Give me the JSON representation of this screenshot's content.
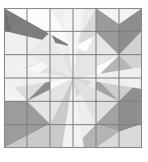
{
  "figure": {
    "kind": "quilt-block-pattern",
    "title": "",
    "canvas": {
      "width": 148,
      "height": 162,
      "background": "#ffffff"
    },
    "block": {
      "x": 4,
      "y": 8,
      "width": 138,
      "height": 140,
      "rows": 6,
      "cols": 6,
      "cell_width": 23.0,
      "cell_height": 23.333,
      "border_color": "#8a8a8a",
      "border_width": 1.1,
      "grid_line_color": "#7d7d7d",
      "grid_line_width": 1.0,
      "grid_visible": true
    },
    "palette": {
      "background": "#ffffff",
      "white": "#fdfdfd",
      "lightest": "#f2f2f2",
      "lighter": "#e8e8e8",
      "light": "#dcdcdc",
      "light_mid": "#cfcfcf",
      "mid": "#bdbdbd",
      "mid_dark": "#a8a8a8",
      "dark": "#8f8f8f",
      "darkest": "#6f6f6f",
      "outline": "#7d7d7d"
    },
    "motifs": [
      {
        "name": "pinwheel-star-top-left",
        "quadrant": "top-left",
        "center": {
          "x": 38.5,
          "y": 43.0
        },
        "rays": 8,
        "dominant_shade": "#6f6f6f"
      },
      {
        "name": "pinwheel-star-top-right",
        "quadrant": "top-right",
        "center": {
          "x": 107.5,
          "y": 43.0
        },
        "rays": 8,
        "dominant_shade": "#8f8f8f"
      },
      {
        "name": "pinwheel-star-bottom-left",
        "quadrant": "bottom-left",
        "center": {
          "x": 38.5,
          "y": 113.0
        },
        "rays": 8,
        "dominant_shade": "#8f8f8f"
      },
      {
        "name": "pinwheel-star-bottom-right",
        "quadrant": "bottom-right",
        "center": {
          "x": 107.5,
          "y": 113.0
        },
        "rays": 8,
        "dominant_shade": "#8f8f8f"
      },
      {
        "name": "central-starburst",
        "quadrant": "center",
        "center": {
          "x": 73.0,
          "y": 78.0
        },
        "rays": 8,
        "dominant_shade": "#cfcfcf"
      }
    ],
    "shapes": [
      {
        "id": "tl-dark-wedge-upper",
        "points": "4,8 73,47 4,31",
        "fill": "#6f6f6f"
      },
      {
        "id": "tl-dark-wedge-lower",
        "points": "4,8 73,47 27,78",
        "fill": "#7d7d7d"
      },
      {
        "id": "tl-light-wedge-a",
        "points": "4,31 73,47 4,78",
        "fill": "#f0f0f0"
      },
      {
        "id": "tl-light-wedge-b",
        "points": "27,78 73,47 73,78",
        "fill": "#e2e2e2"
      },
      {
        "id": "tl-pale-top",
        "points": "4,8 50,8 73,47",
        "fill": "#fbfbfb"
      },
      {
        "id": "tl-pale-right",
        "points": "50,8 73,8 73,47",
        "fill": "#efefef"
      },
      {
        "id": "tl-pale-bottom",
        "points": "4,78 73,47 4,101",
        "fill": "#f7f7f7"
      },
      {
        "id": "tr-pale-left",
        "points": "73,8 96,8 73,47",
        "fill": "#ececec"
      },
      {
        "id": "tr-wedge-left-dark",
        "points": "96,8 73,47 119,24",
        "fill": "#d9d9d9"
      },
      {
        "id": "tr-wedge-core",
        "points": "96,8 119,24 119,55 96,55",
        "fill": "#9a9a9a"
      },
      {
        "id": "tr-wedge-upper-right",
        "points": "119,24 142,8 142,31 119,55",
        "fill": "#8d8d8d"
      },
      {
        "id": "tr-pale-corner",
        "points": "96,8 142,8 119,24",
        "fill": "#f3f3f3"
      },
      {
        "id": "tr-wedge-lower",
        "points": "96,55 119,55 73,78",
        "fill": "#c4c4c4"
      },
      {
        "id": "tr-wedge-lower-right",
        "points": "119,55 142,31 142,78 96,78",
        "fill": "#b6b6b6"
      },
      {
        "id": "tr-pale-lowerleft",
        "points": "73,47 96,55 96,78 73,78",
        "fill": "#e4e4e4"
      },
      {
        "id": "tr-pale-right-edge",
        "points": "142,31 142,78 119,55",
        "fill": "#d2d2d2"
      },
      {
        "id": "bl-wedge-top",
        "points": "4,78 50,78 27,101",
        "fill": "#dcdcdc"
      },
      {
        "id": "bl-wedge-core",
        "points": "27,101 50,78 73,78 50,124",
        "fill": "#aeaeae"
      },
      {
        "id": "bl-wedge-dark",
        "points": "27,101 50,124 4,148 4,101",
        "fill": "#9c9c9c"
      },
      {
        "id": "bl-wedge-darkest",
        "points": "27,101 50,78 50,124",
        "fill": "#8c8c8c"
      },
      {
        "id": "bl-pale-left",
        "points": "4,78 27,101 4,101",
        "fill": "#f4f4f4"
      },
      {
        "id": "bl-pale-bottom",
        "points": "50,124 73,78 73,148 4,148",
        "fill": "#cacaca"
      },
      {
        "id": "bl-white-notch",
        "points": "50,78 73,78 50,124",
        "fill": "#fafafa"
      },
      {
        "id": "br-wedge-left",
        "points": "73,78 96,78 73,101",
        "fill": "#d7d7d7"
      },
      {
        "id": "br-wedge-upper",
        "points": "96,78 142,78 119,101",
        "fill": "#cdcdcd"
      },
      {
        "id": "br-wedge-core",
        "points": "96,78 119,101 119,132 96,124",
        "fill": "#a2a2a2"
      },
      {
        "id": "br-wedge-dark",
        "points": "119,101 142,78 142,124 119,132",
        "fill": "#8f8f8f"
      },
      {
        "id": "br-wedge-lower",
        "points": "96,124 119,132 96,148 73,148",
        "fill": "#b4b4b4"
      },
      {
        "id": "br-pale-leftlow",
        "points": "73,101 96,78 96,124 73,148",
        "fill": "#ededed"
      },
      {
        "id": "br-pale-corner",
        "points": "119,132 142,124 142,148 96,148",
        "fill": "#dadada"
      },
      {
        "id": "center-ray-n",
        "points": "73,78 62,8 84,8",
        "fill": "#f4f4f4"
      },
      {
        "id": "center-ray-ne",
        "points": "73,78 96,32 119,55",
        "fill": "#e6e6e6"
      },
      {
        "id": "center-ray-e",
        "points": "73,78 142,67 142,89",
        "fill": "#efefef"
      },
      {
        "id": "center-ray-se",
        "points": "73,78 119,101 96,124",
        "fill": "#e0e0e0"
      },
      {
        "id": "center-ray-s",
        "points": "73,78 62,148 84,148",
        "fill": "#f2f2f2"
      },
      {
        "id": "center-ray-sw",
        "points": "73,78 50,124 27,101",
        "fill": "#e4e4e4"
      },
      {
        "id": "center-ray-w",
        "points": "73,78 4,67 4,89",
        "fill": "#f1f1f1"
      },
      {
        "id": "center-ray-nw",
        "points": "73,78 27,55 50,32",
        "fill": "#e9e9e9"
      }
    ],
    "grid_lines": {
      "vertical_x": [
        4,
        27,
        50,
        73,
        96,
        119,
        142
      ],
      "horizontal_y": [
        8,
        31.33,
        54.67,
        78,
        101.33,
        124.67,
        148
      ]
    }
  }
}
